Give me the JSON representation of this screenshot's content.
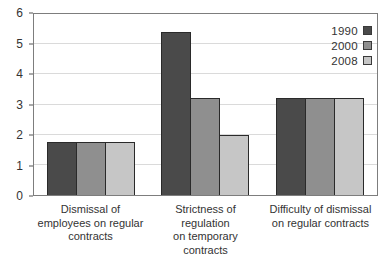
{
  "chart_data": {
    "type": "bar",
    "title": "",
    "xlabel": "",
    "ylabel": "",
    "categories": [
      [
        "Dismissal of",
        "employees on regular",
        "contracts"
      ],
      [
        "Strictness of regulation",
        "on temporary contracts"
      ],
      [
        "Difficulty of dismissal",
        "on regular contracts"
      ]
    ],
    "series": [
      {
        "name": "1990",
        "color": "#4a4a4a",
        "values": [
          1.75,
          5.4,
          3.2
        ]
      },
      {
        "name": "2000",
        "color": "#8f8f8f",
        "values": [
          1.75,
          3.2,
          3.2
        ]
      },
      {
        "name": "2008",
        "color": "#c6c6c6",
        "values": [
          1.75,
          2.0,
          3.2
        ]
      }
    ],
    "ylim": [
      0,
      6
    ],
    "ytick_labels": [
      "0",
      "1",
      "2",
      "3",
      "4",
      "5",
      "6"
    ],
    "grid": "horizontal",
    "legend_position": "top-right",
    "colors": {
      "bar_border": "#2a2a2a",
      "gridline": "#dadada",
      "plot_border": "#7d7d7d",
      "text": "#333333",
      "background": "#ffffff"
    }
  }
}
